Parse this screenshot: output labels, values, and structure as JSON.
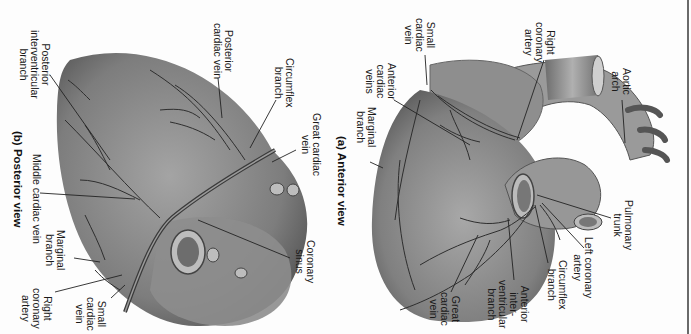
{
  "figure": {
    "orientation": "rotated 90 degrees clockwise",
    "panels": [
      {
        "id": "posterior",
        "caption": "(b) Posterior view",
        "labels": [
          {
            "text": "Posterior\ninterventricular\nbranch"
          },
          {
            "text": "Posterior\ncardiac vein"
          },
          {
            "text": "Circumflex\nbranch"
          },
          {
            "text": "Great cardiac\nvein"
          },
          {
            "text": "Middle cardiac vein"
          },
          {
            "text": "Coronary\nsinus"
          },
          {
            "text": "Marginal\nbranch"
          },
          {
            "text": "Right\ncoronary\nartery"
          },
          {
            "text": "Small\ncardiac\nvein"
          }
        ]
      },
      {
        "id": "anterior",
        "caption": "(a) Anterior view",
        "labels": [
          {
            "text": "Small\ncardiac\nvein"
          },
          {
            "text": "Right\ncoronary\nartery"
          },
          {
            "text": "Aortic\narch"
          },
          {
            "text": "Anterior\ncardiac\nveins"
          },
          {
            "text": "Marginal\nbranch"
          },
          {
            "text": "Pulmonary\ntrunk"
          },
          {
            "text": "Left coronary\nartery"
          },
          {
            "text": "Circumflex\nbranch"
          },
          {
            "text": "Anterior\ninter-\nventricular\nbranch"
          },
          {
            "text": "Great\ncardiac\nvein"
          }
        ]
      }
    ]
  },
  "colors": {
    "background": "#fdfdfd",
    "heart_fill": "#8a8a8a",
    "heart_dark": "#5c5c5c",
    "vessel": "#2e2e2e",
    "text": "#1a1a1a"
  }
}
